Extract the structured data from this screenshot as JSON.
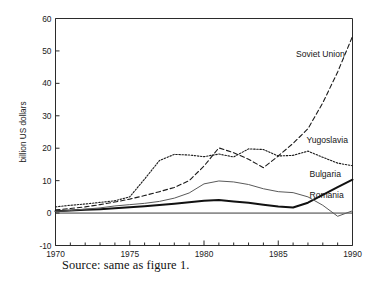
{
  "figure": {
    "caption": "Source: same as figure 1.",
    "background_color": "#ffffff",
    "axis_color": "#2b2b2b"
  },
  "chart_data": {
    "type": "line",
    "title": "",
    "subtitle": "",
    "xlabel": "",
    "ylabel": "billion US dollars",
    "xlim": [
      1970,
      1990
    ],
    "ylim": [
      -10,
      60
    ],
    "grid": false,
    "legend_position": "inline-right-labels",
    "x_major_ticks": [
      1970,
      1975,
      1980,
      1985,
      1990
    ],
    "x_major_tick_labels": [
      "1970",
      "1975",
      "1980",
      "1985",
      "1990"
    ],
    "x_minor_tick_interval": 1,
    "y_ticks": [
      -10,
      0,
      10,
      20,
      30,
      40,
      50,
      60
    ],
    "y_tick_labels": [
      "-10",
      "0",
      "10",
      "20",
      "30",
      "40",
      "50",
      "60"
    ],
    "zero_reference_line": 0,
    "x": [
      1970,
      1971,
      1972,
      1973,
      1974,
      1975,
      1976,
      1977,
      1978,
      1979,
      1980,
      1981,
      1982,
      1983,
      1984,
      1985,
      1986,
      1987,
      1988,
      1989,
      1990
    ],
    "series": [
      {
        "name": "Soviet Union",
        "label": "Soviet Union",
        "line_style": "dashed",
        "color": "#1a1a1a",
        "line_width": 1.1,
        "values": [
          1.0,
          1.4,
          1.9,
          2.6,
          3.4,
          4.3,
          5.4,
          6.6,
          7.9,
          10.0,
          14.5,
          20.1,
          18.6,
          16.6,
          14.0,
          17.6,
          21.5,
          26.0,
          34.0,
          43.5,
          54.5
        ]
      },
      {
        "name": "Yugoslavia",
        "label": "Yugoslavia",
        "line_style": "dotted",
        "color": "#1a1a1a",
        "line_width": 1.1,
        "values": [
          1.9,
          2.4,
          2.8,
          3.3,
          3.8,
          5.0,
          10.5,
          16.2,
          18.1,
          17.9,
          17.4,
          18.2,
          17.3,
          19.8,
          19.6,
          17.6,
          17.8,
          19.1,
          17.2,
          15.4,
          14.6
        ]
      },
      {
        "name": "Bulgaria",
        "label": "Bulgaria",
        "line_style": "solid",
        "color": "#111111",
        "line_width": 2.0,
        "values": [
          0.6,
          0.8,
          1.0,
          1.2,
          1.5,
          1.8,
          2.1,
          2.5,
          2.9,
          3.3,
          3.8,
          4.0,
          3.6,
          3.2,
          2.6,
          2.0,
          1.7,
          3.2,
          5.6,
          8.0,
          10.3
        ]
      },
      {
        "name": "Romania",
        "label": "Romania",
        "line_style": "solid",
        "color": "#5a5a5a",
        "line_width": 1.0,
        "values": [
          0.5,
          0.8,
          1.2,
          1.6,
          2.2,
          2.6,
          3.0,
          3.6,
          4.6,
          6.2,
          9.0,
          9.9,
          9.6,
          8.8,
          7.5,
          6.6,
          6.3,
          5.0,
          2.4,
          -1.0,
          0.7
        ]
      }
    ],
    "annotations": [
      {
        "text": "Soviet Union",
        "x": 1986.2,
        "y": 48.0
      },
      {
        "text": "Yugoslavia",
        "x": 1986.9,
        "y": 21.5
      },
      {
        "text": "Bulgaria",
        "x": 1987.1,
        "y": 11.2
      },
      {
        "text": "Romania",
        "x": 1987.1,
        "y": 4.6
      }
    ]
  }
}
